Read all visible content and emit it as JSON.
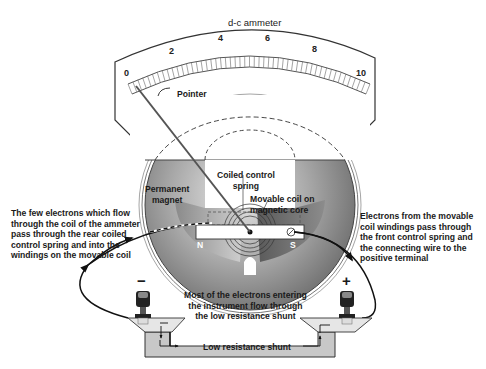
{
  "meter": {
    "title": "d-c ammeter",
    "scale_ticks": [
      "0",
      "2",
      "4",
      "6",
      "8",
      "10"
    ],
    "scale_range": [
      0,
      10
    ]
  },
  "labels": {
    "pointer": "Pointer",
    "permanent_magnet": "Permanent\nmagnet",
    "coiled_control_spring": "Coiled control\nspring",
    "movable_coil": "Movable coil on\nmagnetic core",
    "pole_north": "N",
    "pole_south": "S",
    "left_note": "The few electrons which flow\nthrough the coil of the ammeter\npass through the rear coiled\ncontrol spring and into the\nwindings on the movable coil",
    "right_note": "Electrons from the movable\ncoil windings pass through\nthe  front control spring and\nthe connecting wire to the\npositive terminal",
    "center_note": "Most of the electrons entering\nthe instrument flow through\nthe low resistance shunt",
    "shunt": "Low resistance shunt"
  },
  "terminals": {
    "negative": "−",
    "positive": "+"
  },
  "colors": {
    "case_line": "#333333",
    "magnet_gray": "#9a9a9a",
    "shunt_fill": "#c8c8c8",
    "text": "#1a1a1a"
  }
}
